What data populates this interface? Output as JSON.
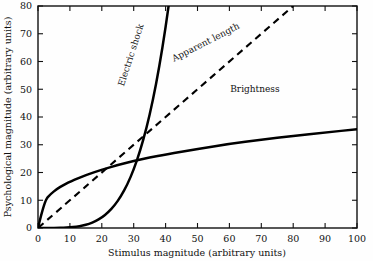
{
  "chart_data": {
    "type": "line",
    "title": "",
    "xlabel": "Stimulus magnitude (arbitrary units)",
    "ylabel": "Psychological magnitude (arbitrary units)",
    "xlim": [
      0,
      100
    ],
    "ylim": [
      0,
      80
    ],
    "xticks": [
      0,
      10,
      20,
      30,
      40,
      50,
      60,
      70,
      80,
      90,
      100
    ],
    "yticks": [
      0,
      10,
      20,
      30,
      40,
      50,
      60,
      70,
      80
    ],
    "grid": false,
    "legend_position": "inline-labels",
    "series": [
      {
        "name": "Electric shock",
        "style": "solid",
        "label_rotation": -72,
        "exponent": 3.5,
        "x": [
          0,
          2,
          4,
          6,
          8,
          10,
          12,
          14,
          16,
          18,
          20,
          22,
          24,
          26,
          28,
          30,
          32,
          34,
          36,
          38,
          40,
          42,
          44,
          45
        ],
        "y": [
          0,
          0.0,
          0.01,
          0.04,
          0.1,
          0.23,
          0.47,
          0.86,
          1.49,
          2.42,
          3.76,
          5.62,
          8.12,
          11.41,
          15.65,
          21.02,
          27.71,
          35.94,
          45.92,
          57.91,
          72.15,
          88.92,
          108.5,
          119.5
        ]
      },
      {
        "name": "Apparent length",
        "style": "dashed",
        "label_rotation": -27,
        "exponent": 1.0,
        "x": [
          0,
          10,
          20,
          30,
          40,
          50,
          60,
          70,
          80
        ],
        "y": [
          0,
          10,
          20,
          30,
          40,
          50,
          60,
          70,
          80
        ]
      },
      {
        "name": "Brightness",
        "style": "solid",
        "label_rotation": 0,
        "exponent": 0.33,
        "x": [
          0,
          2,
          4,
          6,
          8,
          10,
          15,
          20,
          25,
          30,
          35,
          40,
          50,
          60,
          70,
          80,
          90,
          100
        ],
        "y": [
          0,
          9.8,
          12.3,
          14.1,
          15.5,
          16.7,
          19.1,
          21.0,
          22.7,
          24.1,
          25.4,
          26.5,
          28.5,
          30.3,
          31.8,
          33.2,
          34.4,
          35.6
        ]
      }
    ],
    "annotations": [
      {
        "text": "Electric shock",
        "x": 30,
        "y": 62
      },
      {
        "text": "Apparent length",
        "x": 53,
        "y": 66
      },
      {
        "text": "Brightness",
        "x": 68,
        "y": 49
      }
    ],
    "colors": {
      "axis": "#111111",
      "curve": "#000000",
      "background": "#fefefe"
    }
  },
  "axes": {
    "x_title": "Stimulus magnitude (arbitrary units)",
    "y_title": "Psychological magnitude (arbitrary units)",
    "x_tick_labels": [
      "0",
      "10",
      "20",
      "30",
      "40",
      "50",
      "60",
      "70",
      "80",
      "90",
      "100"
    ],
    "y_tick_labels": [
      "0",
      "10",
      "20",
      "30",
      "40",
      "50",
      "60",
      "70",
      "80"
    ]
  },
  "labels": {
    "electric_shock": "Electric shock",
    "apparent_length": "Apparent length",
    "brightness": "Brightness"
  }
}
